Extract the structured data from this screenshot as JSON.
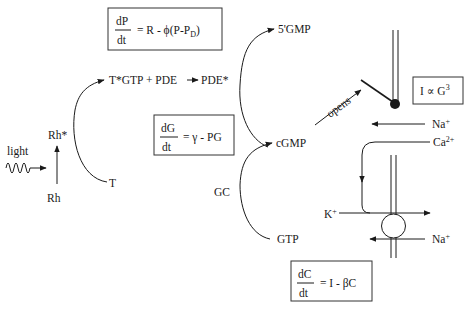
{
  "equations": {
    "dPdt": {
      "numerator": "dP",
      "denominator": "dt",
      "rhs": "= R - ϕ(P-P",
      "rhs_sub": "D",
      "rhs_end": ")"
    },
    "dGdt": {
      "numerator": "dG",
      "denominator": "dt",
      "rhs": "= γ - PG"
    },
    "dCdt": {
      "numerator": "dC",
      "denominator": "dt",
      "rhs": "= I - βC"
    },
    "current": {
      "lhs": "I ∝ G",
      "sup": "3"
    }
  },
  "labels": {
    "light": "light",
    "rh": "Rh",
    "rh_star": "Rh*",
    "t": "T",
    "tgtp_pde": "T*GTP + PDE",
    "pde_star": "PDE*",
    "five_gmp": "5'GMP",
    "cgmp": "cGMP",
    "gc": "GC",
    "gtp": "GTP",
    "opens": "opens",
    "na_top": "Na",
    "na_top_sup": "+",
    "ca": "Ca",
    "ca_sup": "2+",
    "k": "K",
    "k_sup": "+",
    "na_bottom": "Na",
    "na_bottom_sup": "+"
  },
  "colors": {
    "ink": "#1a1a1a",
    "box_border": "#333333",
    "background": "#ffffff"
  }
}
